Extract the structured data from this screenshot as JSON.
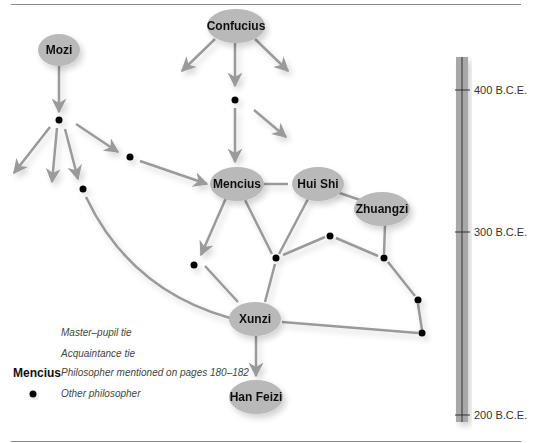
{
  "diagram": {
    "colors": {
      "node_fill": "#b9b9b9",
      "edge": "#9a9a9a",
      "dot": "#000000",
      "timeline_bar": "#a8a8a8",
      "timeline_line": "#333333"
    },
    "named_philosophers": [
      {
        "id": "mozi",
        "label": "Mozi"
      },
      {
        "id": "confucius",
        "label": "Confucius"
      },
      {
        "id": "mencius",
        "label": "Mencius"
      },
      {
        "id": "huishi",
        "label": "Hui Shi"
      },
      {
        "id": "zhuangzi",
        "label": "Zhuangzi"
      },
      {
        "id": "xunzi",
        "label": "Xunzi"
      },
      {
        "id": "hanfeizi",
        "label": "Han Feizi"
      }
    ],
    "other_philosopher_count": 12
  },
  "legend": {
    "master_pupil": "Master–pupil tie",
    "acquaintance": "Acquaintance tie",
    "philosopher_example": "Mencius",
    "philosopher_desc": "Philosopher mentioned on pages 180–182",
    "other": "Other philosopher"
  },
  "timeline": {
    "ticks": [
      {
        "label": "400 B.C.E."
      },
      {
        "label": "300 B.C.E."
      },
      {
        "label": "200 B.C.E."
      }
    ]
  }
}
